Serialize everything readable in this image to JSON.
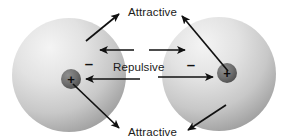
{
  "diagram": {
    "title_top": "Attractive",
    "title_middle": "Repulsive",
    "title_bottom": "Attractive",
    "background_color": "#ffffff",
    "stroke_color": "#111111",
    "atoms": [
      {
        "id": "left-atom",
        "cloud_center_x": 69,
        "cloud_center_y": 75,
        "cloud_radius": 57,
        "cloud_fill_light": "#f0f0f0",
        "cloud_fill_dark": "#9a9a9a",
        "nucleus_center_x": 71,
        "nucleus_center_y": 79,
        "nucleus_radius": 10,
        "nucleus_fill": "#6d6d6d",
        "nucleus_label": "+",
        "electron_label": "–",
        "electron_x": 89,
        "electron_y": 64
      },
      {
        "id": "right-atom",
        "cloud_center_x": 219,
        "cloud_center_y": 74,
        "cloud_radius": 57,
        "cloud_fill_light": "#f0f0f0",
        "cloud_fill_dark": "#9a9a9a",
        "nucleus_center_x": 227,
        "nucleus_center_y": 73,
        "nucleus_radius": 10,
        "nucleus_fill": "#6d6d6d",
        "nucleus_label": "+",
        "electron_label": "–",
        "electron_x": 191,
        "electron_y": 65
      }
    ],
    "labels": [
      {
        "name": "attractive-top",
        "text": "Attractive",
        "x": 128,
        "y": 16
      },
      {
        "name": "repulsive-middle",
        "text": "Repulsive",
        "x": 113,
        "y": 71
      },
      {
        "name": "attractive-bottom",
        "text": "Attractive",
        "x": 128,
        "y": 136
      }
    ],
    "arrows": [
      {
        "name": "repulsive-electron-left",
        "x1": 134,
        "y1": 50,
        "x2": 100,
        "y2": 50,
        "style": "solid"
      },
      {
        "name": "repulsive-electron-right",
        "x1": 149,
        "y1": 50,
        "x2": 185,
        "y2": 50,
        "style": "solid"
      },
      {
        "name": "repulsive-nucleus-left",
        "x1": 140,
        "y1": 79,
        "x2": 86,
        "y2": 79,
        "style": "solid"
      },
      {
        "name": "repulsive-nucleus-right",
        "x1": 158,
        "y1": 77,
        "x2": 213,
        "y2": 77,
        "style": "solid"
      },
      {
        "name": "attractive-top-left",
        "x1": 86,
        "y1": 41,
        "x2": 119,
        "y2": 14,
        "style": "solid"
      },
      {
        "name": "attractive-top-right",
        "x1": 228,
        "y1": 71,
        "x2": 182,
        "y2": 16,
        "style": "solid"
      },
      {
        "name": "attractive-bottom-left",
        "x1": 73,
        "y1": 84,
        "x2": 119,
        "y2": 128,
        "style": "solid"
      },
      {
        "name": "attractive-bottom-right",
        "x1": 226,
        "y1": 105,
        "x2": 188,
        "y2": 130,
        "style": "solid"
      }
    ]
  }
}
